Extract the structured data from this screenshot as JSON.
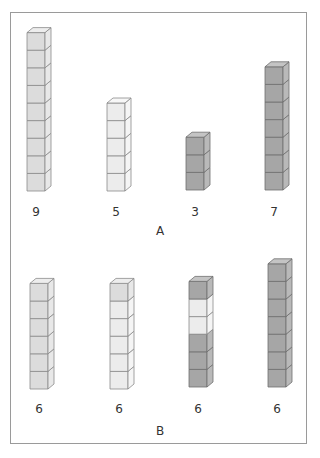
{
  "colors": {
    "light": {
      "front": "#ececec",
      "side": "#f5f5f5",
      "top": "#f7f7f7",
      "stroke": "#8a8a8a"
    },
    "medium_light": {
      "front": "#dcdcdc",
      "side": "#e8e8e8",
      "top": "#ededed",
      "stroke": "#8a8a8a"
    },
    "dark": {
      "front": "#a6a6a6",
      "side": "#b9b9b9",
      "top": "#c4c4c4",
      "stroke": "#6e6e6e"
    },
    "border": "#9a9a9a"
  },
  "groups": [
    {
      "label": "A",
      "label_x": 160,
      "label_y": 224,
      "towers": [
        {
          "count_label": "9",
          "cubes": [
            "medium_light",
            "medium_light",
            "medium_light",
            "medium_light",
            "medium_light",
            "medium_light",
            "medium_light",
            "medium_light",
            "medium_light"
          ],
          "x": 27,
          "base_y": 191
        },
        {
          "count_label": "5",
          "cubes": [
            "light",
            "light",
            "light",
            "light",
            "light"
          ],
          "x": 107,
          "base_y": 191
        },
        {
          "count_label": "3",
          "cubes": [
            "dark",
            "dark",
            "dark"
          ],
          "x": 186,
          "base_y": 190
        },
        {
          "count_label": "7",
          "cubes": [
            "dark",
            "dark",
            "dark",
            "dark",
            "dark",
            "dark",
            "dark"
          ],
          "x": 265,
          "base_y": 190
        }
      ],
      "count_y": 205
    },
    {
      "label": "B",
      "label_x": 160,
      "label_y": 424,
      "towers": [
        {
          "count_label": "6",
          "cubes": [
            "medium_light",
            "medium_light",
            "medium_light",
            "medium_light",
            "medium_light",
            "medium_light"
          ],
          "x": 30,
          "base_y": 389
        },
        {
          "count_label": "6",
          "cubes": [
            "light",
            "light",
            "light",
            "light",
            "light",
            "medium_light"
          ],
          "x": 110,
          "base_y": 389
        },
        {
          "count_label": "6",
          "cubes": [
            "dark",
            "dark",
            "dark",
            "light",
            "light",
            "dark"
          ],
          "x": 189,
          "base_y": 387
        },
        {
          "count_label": "6",
          "cubes": [
            "dark",
            "dark",
            "dark",
            "dark",
            "dark",
            "dark",
            "dark"
          ],
          "x": 268,
          "base_y": 387
        }
      ],
      "count_y": 402
    }
  ]
}
